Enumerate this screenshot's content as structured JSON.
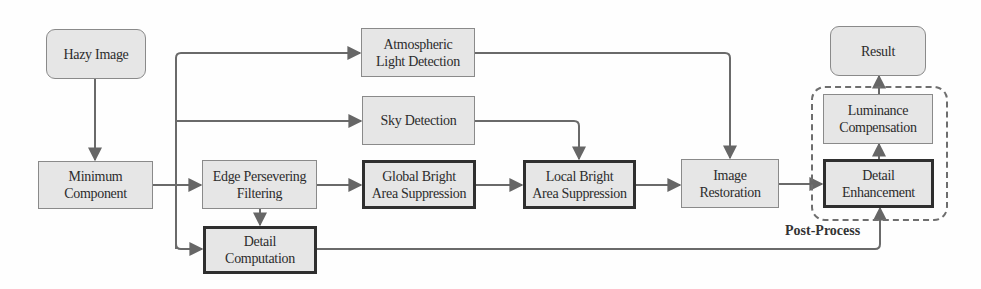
{
  "diagram": {
    "nodes": {
      "hazy_image": "Hazy Image",
      "minimum_component": "Minimum\nComponent",
      "atmospheric_light": "Atmospheric\nLight Detection",
      "sky_detection": "Sky Detection",
      "edge_filtering": "Edge Persevering\nFiltering",
      "detail_computation": "Detail\nComputation",
      "global_bright": "Global Bright\nArea Suppression",
      "local_bright": "Local Bright\nArea Suppression",
      "image_restoration": "Image\nRestoration",
      "detail_enhancement": "Detail\nEnhancement",
      "luminance_compensation": "Luminance\nCompensation",
      "result": "Result"
    },
    "group_label": "Post-Process",
    "edges": [
      [
        "Hazy Image",
        "Minimum Component"
      ],
      [
        "Minimum Component",
        "Atmospheric Light Detection"
      ],
      [
        "Minimum Component",
        "Sky Detection"
      ],
      [
        "Minimum Component",
        "Edge Persevering Filtering"
      ],
      [
        "Minimum Component",
        "Detail Computation"
      ],
      [
        "Edge Persevering Filtering",
        "Detail Computation"
      ],
      [
        "Edge Persevering Filtering",
        "Global Bright Area Suppression"
      ],
      [
        "Global Bright Area Suppression",
        "Local Bright Area Suppression"
      ],
      [
        "Sky Detection",
        "Local Bright Area Suppression"
      ],
      [
        "Local Bright Area Suppression",
        "Image Restoration"
      ],
      [
        "Atmospheric Light Detection",
        "Image Restoration"
      ],
      [
        "Image Restoration",
        "Detail Enhancement"
      ],
      [
        "Detail Computation",
        "Detail Enhancement"
      ],
      [
        "Detail Enhancement",
        "Luminance Compensation"
      ],
      [
        "Luminance Compensation",
        "Result"
      ]
    ],
    "colors": {
      "node_fill": "#e6e6e6",
      "node_border": "#8a8a8a",
      "bold_border": "#2f2f2f",
      "wire": "#6a6a6a"
    }
  }
}
